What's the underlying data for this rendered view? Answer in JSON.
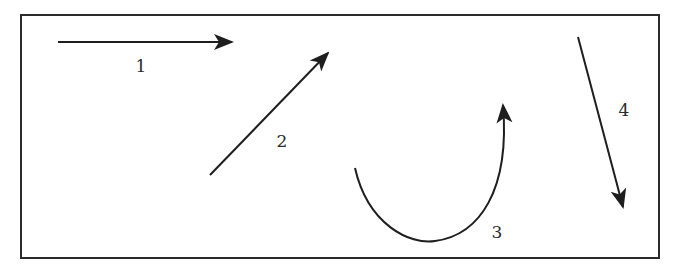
{
  "diagram": {
    "frame": {
      "x": 21,
      "y": 15,
      "width": 638,
      "height": 243,
      "stroke": "#2b2b2b"
    },
    "stroke_color": "#1e1e1e",
    "arrows": [
      {
        "id": "1",
        "label": "1",
        "kind": "straight",
        "from": [
          58,
          42
        ],
        "to": [
          232,
          42
        ],
        "label_pos": [
          141,
          66
        ]
      },
      {
        "id": "2",
        "label": "2",
        "kind": "straight",
        "from": [
          210,
          175
        ],
        "to": [
          328,
          53
        ],
        "label_pos": [
          282,
          141
        ]
      },
      {
        "id": "3",
        "label": "3",
        "kind": "curved",
        "path": "M 355 168 C 368 225, 410 245, 435 241 C 480 235, 510 190, 503 108",
        "label_pos": [
          497,
          232
        ]
      },
      {
        "id": "4",
        "label": "4",
        "kind": "straight",
        "from": [
          578,
          37
        ],
        "to": [
          623,
          207
        ],
        "label_pos": [
          624,
          110
        ]
      }
    ]
  }
}
